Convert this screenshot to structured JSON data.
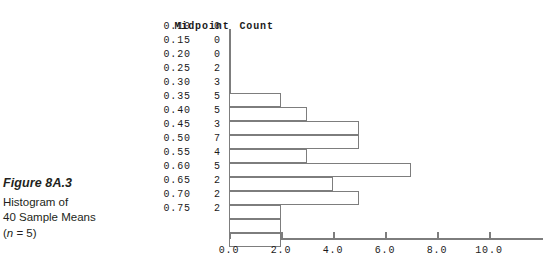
{
  "caption": {
    "figure_number": "Figure 8A.3",
    "line1": "Histogram of",
    "line2": "40 Sample Means",
    "line3_prefix": "(",
    "line3_italic": "n",
    "line3_suffix": " = 5)"
  },
  "table": {
    "header_midpoint": "Midpoint",
    "header_count": "Count",
    "rows": [
      {
        "midpoint": "0.10",
        "count": "0"
      },
      {
        "midpoint": "0.15",
        "count": "0"
      },
      {
        "midpoint": "0.20",
        "count": "0"
      },
      {
        "midpoint": "0.25",
        "count": "2"
      },
      {
        "midpoint": "0.30",
        "count": "3"
      },
      {
        "midpoint": "0.35",
        "count": "5"
      },
      {
        "midpoint": "0.40",
        "count": "5"
      },
      {
        "midpoint": "0.45",
        "count": "3"
      },
      {
        "midpoint": "0.50",
        "count": "7"
      },
      {
        "midpoint": "0.55",
        "count": "4"
      },
      {
        "midpoint": "0.60",
        "count": "5"
      },
      {
        "midpoint": "0.65",
        "count": "2"
      },
      {
        "midpoint": "0.70",
        "count": "2"
      },
      {
        "midpoint": "0.75",
        "count": "2"
      }
    ]
  },
  "axis": {
    "tick_labels": [
      "0.0",
      "2.0",
      "4.0",
      "6.0",
      "8.0",
      "10.0"
    ],
    "tick_values": [
      0,
      2,
      4,
      6,
      8,
      10
    ]
  },
  "colors": {
    "line": "#7d7d7d",
    "text": "#1a1a1a",
    "caption_text": "#231f20",
    "bar_fill": "#ffffff"
  },
  "chart_data": {
    "type": "bar",
    "orientation": "horizontal",
    "title": "Histogram of 40 Sample Means (n = 5)",
    "xlabel": "",
    "ylabel": "",
    "categories": [
      "0.10",
      "0.15",
      "0.20",
      "0.25",
      "0.30",
      "0.35",
      "0.40",
      "0.45",
      "0.50",
      "0.55",
      "0.60",
      "0.65",
      "0.70",
      "0.75"
    ],
    "values": [
      0,
      0,
      0,
      2,
      3,
      5,
      5,
      3,
      7,
      4,
      5,
      2,
      2,
      2
    ],
    "category_label": "Midpoint",
    "value_label": "Count",
    "xlim": [
      0,
      11.5
    ],
    "xticks": [
      0,
      2,
      4,
      6,
      8,
      10
    ],
    "xticklabels": [
      "0.0",
      "2.0",
      "4.0",
      "6.0",
      "8.0",
      "10.0"
    ],
    "grid": false,
    "legend": false,
    "total_count": 40,
    "sample_size": 5
  },
  "geometry": {
    "origin_x": 229,
    "plot_top": 29,
    "row_height": 14,
    "px_per_unit": 26,
    "axis_y": 238
  }
}
